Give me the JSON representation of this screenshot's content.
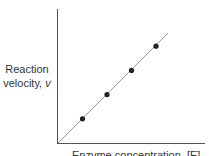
{
  "chart_data": {
    "type": "scatter",
    "title": "",
    "xlabel": "Enzyme concentration, [E]",
    "ylabel": "Reaction velocity, v",
    "ylabel_lines": [
      "Reaction",
      "velocity, "
    ],
    "ylabel_var": "v",
    "x": [
      1,
      2,
      3,
      4
    ],
    "values": [
      1,
      2,
      3,
      4
    ],
    "series": [
      {
        "name": "data",
        "type": "scatter",
        "x": [
          1,
          2,
          3,
          4
        ],
        "y": [
          1,
          2,
          3,
          4
        ]
      },
      {
        "name": "fit",
        "type": "line",
        "x": [
          0,
          4.4
        ],
        "y": [
          0,
          4.4
        ]
      }
    ],
    "xlim": [
      0,
      5.9
    ],
    "ylim": [
      0,
      5.4
    ],
    "ticks": "none",
    "grid": false,
    "legend": "none",
    "colors": {
      "axis": "#555555",
      "line": "#999999",
      "points": "#222222"
    }
  }
}
